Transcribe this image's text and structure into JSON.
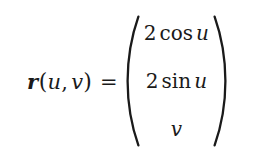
{
  "equation": {
    "lhs": {
      "vector_symbol": "r",
      "open_paren": "(",
      "arg1": "u",
      "comma": ",",
      "arg2": "v",
      "close_paren": ")",
      "relation": "="
    },
    "matrix": {
      "open_delimiter": "(",
      "close_delimiter": ")",
      "rows": [
        {
          "coefficient": "2",
          "function": "cos",
          "argument": "u",
          "plain": ""
        },
        {
          "coefficient": "2",
          "function": "sin",
          "argument": "u",
          "plain": ""
        },
        {
          "coefficient": "",
          "function": "",
          "argument": "",
          "plain": "v"
        }
      ]
    },
    "plain_text": "r(u, v) = (2 cos u, 2 sin u, v)"
  },
  "style": {
    "background_color": "#ffffff",
    "text_color": "#1a1a1a"
  }
}
